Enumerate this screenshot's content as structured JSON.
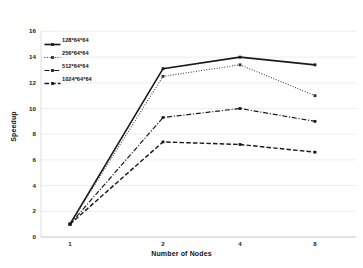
{
  "chart_data": {
    "type": "line",
    "title": "",
    "xlabel": "Number of Nodes",
    "ylabel": "Speedup",
    "x": [
      1,
      2,
      4,
      8
    ],
    "categories": [
      "1",
      "2",
      "4",
      "8"
    ],
    "xtick_labels": [
      "1",
      "2",
      "4",
      "8"
    ],
    "ytick_labels": [
      "0",
      "2",
      "4",
      "6",
      "8",
      "10",
      "12",
      "14",
      "16"
    ],
    "yticks": [
      0,
      2,
      4,
      6,
      8,
      10,
      12,
      14,
      16
    ],
    "ylim": [
      0,
      16
    ],
    "grid": "horizontal",
    "legend_position": "upper-left-inside",
    "series": [
      {
        "name": "128*64*64",
        "values": [
          1.0,
          13.1,
          14.0,
          13.4
        ],
        "line_style": "solid",
        "marker": "square",
        "color": "#1a1a1a"
      },
      {
        "name": "256*64*64",
        "values": [
          1.0,
          12.5,
          13.4,
          11.0
        ],
        "line_style": "dotted",
        "marker": "square",
        "color": "#2b2b2b"
      },
      {
        "name": "512*64*64",
        "values": [
          1.0,
          9.3,
          10.0,
          9.0
        ],
        "line_style": "dashdot",
        "marker": "square",
        "color": "#1a1a1a"
      },
      {
        "name": "1024*64*64",
        "values": [
          1.0,
          7.4,
          7.2,
          6.6
        ],
        "line_style": "dashed",
        "marker": "square",
        "color": "#1a1a1a"
      }
    ]
  },
  "axes": {
    "x_title": "Number of Nodes",
    "y_title": "Speedup"
  },
  "legend": {
    "entries": [
      {
        "label": "128*64*64"
      },
      {
        "label": "256*64*64"
      },
      {
        "label": "512*64*64"
      },
      {
        "label": "1024*64*64"
      }
    ]
  },
  "ticks": {
    "y": [
      {
        "label": "16"
      },
      {
        "label": "14"
      },
      {
        "label": "12"
      },
      {
        "label": "10"
      },
      {
        "label": "8"
      },
      {
        "label": "6"
      },
      {
        "label": "4"
      },
      {
        "label": "2"
      },
      {
        "label": "0"
      }
    ],
    "x": [
      {
        "label": "1"
      },
      {
        "label": "2"
      },
      {
        "label": "4"
      },
      {
        "label": "8"
      }
    ]
  },
  "colors": {
    "ink": "#1a1a1a",
    "grid": "#d8d8d8",
    "axis": "#bdbdbd",
    "background": "#ffffff"
  }
}
